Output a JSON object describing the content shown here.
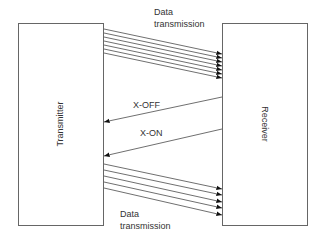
{
  "diagram": {
    "nodes": [
      {
        "id": "transmitter",
        "label": "Transmitter"
      },
      {
        "id": "receiver",
        "label": "Receiver"
      }
    ],
    "labels": {
      "top_data_line1": "Data",
      "top_data_line2": "transmission",
      "x_off": "X-OFF",
      "x_on": "X-ON",
      "bottom_data_line1": "Data",
      "bottom_data_line2": "transmission"
    },
    "edges": [
      {
        "from": "transmitter",
        "to": "receiver",
        "label": "Data transmission",
        "count": 7
      },
      {
        "from": "receiver",
        "to": "transmitter",
        "label": "X-OFF",
        "count": 1
      },
      {
        "from": "receiver",
        "to": "transmitter",
        "label": "X-ON",
        "count": 1
      },
      {
        "from": "transmitter",
        "to": "receiver",
        "label": "Data transmission",
        "count": 5
      }
    ],
    "colors": {
      "line": "#4a4a4a",
      "box_border": "#666666",
      "text": "#333333"
    }
  }
}
